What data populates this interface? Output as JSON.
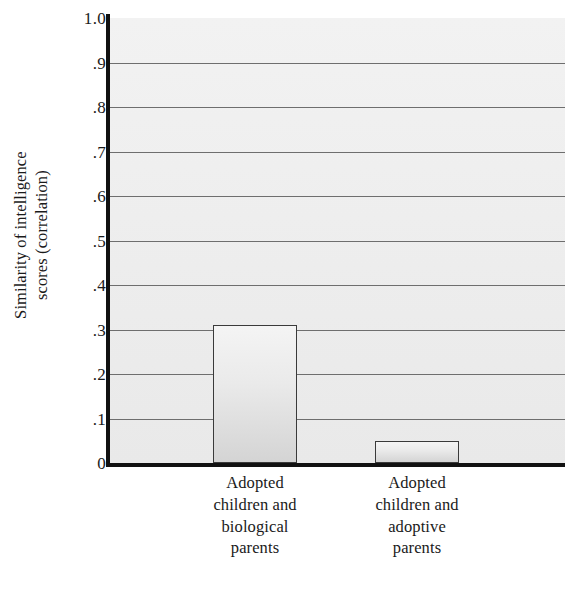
{
  "chart_data": {
    "type": "bar",
    "title": "",
    "xlabel": "",
    "ylabel": "Similarity of intelligence scores (correlation)",
    "ylabel_lines": [
      "Similarity of intelligence",
      "scores (correlation)"
    ],
    "categories": [
      "Adopted children and biological parents",
      "Adopted children and adoptive parents"
    ],
    "category_lines": [
      [
        "Adopted",
        "children and",
        "biological",
        "parents"
      ],
      [
        "Adopted",
        "children and",
        "adoptive",
        "parents"
      ]
    ],
    "values": [
      0.31,
      0.05
    ],
    "ylim": [
      0,
      1.0
    ],
    "ytick_values": [
      1.0,
      0.9,
      0.8,
      0.7,
      0.6,
      0.5,
      0.4,
      0.3,
      0.2,
      0.1,
      0
    ],
    "ytick_labels": [
      "1.0",
      ".9",
      ".8",
      ".7",
      ".6",
      ".5",
      ".4",
      ".3",
      ".2",
      ".1",
      "0"
    ],
    "grid": true,
    "gridline_values": [
      0.9,
      0.8,
      0.7,
      0.6,
      0.5,
      0.4,
      0.3,
      0.2,
      0.1
    ],
    "legend": null,
    "colors": {
      "plot_background": "#eeeeee",
      "gridline": "#6e6e6e",
      "axis": "#111111",
      "bar_fill_top": "#f4f4f4",
      "bar_fill_bottom": "#d4d4d4",
      "bar_border": "#3a3a3a",
      "text": "#1a1a1a"
    }
  }
}
